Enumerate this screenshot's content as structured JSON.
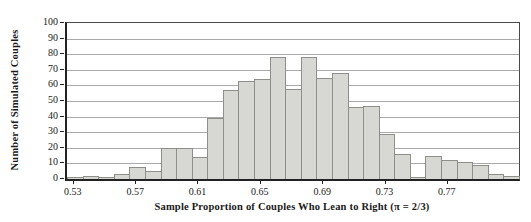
{
  "chart_data": {
    "type": "bar",
    "subtype": "histogram",
    "title": "",
    "xlabel": "Sample Proportion of Couples Who Lean to Right (π = 2/3)",
    "ylabel": "Number of Simulated Couples",
    "ylim": [
      0,
      100
    ],
    "yticks": [
      0,
      10,
      20,
      30,
      40,
      50,
      60,
      70,
      80,
      90,
      100
    ],
    "ytick_labels": [
      "0",
      "10",
      "20",
      "30",
      "40",
      "50",
      "60",
      "70",
      "80",
      "90",
      "100"
    ],
    "xlim": [
      0.525,
      0.815
    ],
    "xticks": [
      0.53,
      0.57,
      0.61,
      0.65,
      0.69,
      0.73,
      0.77
    ],
    "xtick_labels": [
      "0.53",
      "0.57",
      "0.61",
      "0.65",
      "0.69",
      "0.73",
      "0.77"
    ],
    "bin_width": 0.01,
    "bin_centers": [
      0.53,
      0.54,
      0.55,
      0.56,
      0.57,
      0.58,
      0.59,
      0.6,
      0.61,
      0.62,
      0.63,
      0.64,
      0.65,
      0.66,
      0.67,
      0.68,
      0.69,
      0.7,
      0.71,
      0.72,
      0.73,
      0.74,
      0.75,
      0.76,
      0.77,
      0.78,
      0.79,
      0.8,
      0.81
    ],
    "values": [
      1,
      2,
      1,
      3,
      8,
      5,
      20,
      20,
      14,
      39,
      57,
      63,
      64,
      78,
      58,
      78,
      65,
      68,
      46,
      47,
      29,
      16,
      1,
      15,
      12,
      11,
      9,
      3,
      2
    ],
    "grid": "horizontal",
    "legend": "none",
    "bar_fill_color": "#d7d7d4",
    "bar_border_color": "#8e8e8b",
    "gridline_color": "#a9a9a9",
    "axis_color": "#222222"
  }
}
